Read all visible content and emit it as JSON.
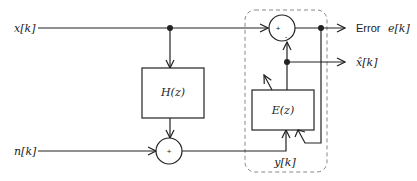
{
  "diagram": {
    "type": "block-diagram",
    "title": "",
    "inputs": [
      {
        "id": "x",
        "label": "x[k]"
      },
      {
        "id": "n",
        "label": "n[k]"
      }
    ],
    "blocks": [
      {
        "id": "H",
        "label": "H(z)"
      },
      {
        "id": "E",
        "label": "E(z)",
        "adaptive": true
      }
    ],
    "summers": [
      {
        "id": "sum_noise",
        "sign_label": "+"
      },
      {
        "id": "sum_error",
        "sign_plus": "+",
        "sign_minus": "-"
      }
    ],
    "outputs": [
      {
        "id": "error",
        "prefix": "Error",
        "label": "e[k]"
      },
      {
        "id": "xhat",
        "label": "x̂[k]"
      }
    ],
    "signals": {
      "y": "y[k]"
    },
    "colors": {
      "line": "#222222",
      "dashed_box": "#888888",
      "background": "#ffffff"
    },
    "connections": [
      {
        "from": "x",
        "to": "H"
      },
      {
        "from": "x",
        "to": "sum_error",
        "sign": "+"
      },
      {
        "from": "H",
        "to": "sum_noise"
      },
      {
        "from": "n",
        "to": "sum_noise"
      },
      {
        "from": "sum_noise",
        "to": "E",
        "signal": "y[k]"
      },
      {
        "from": "E",
        "to": "sum_error",
        "sign": "-"
      },
      {
        "from": "E",
        "to": "xhat"
      },
      {
        "from": "sum_error",
        "to": "error"
      },
      {
        "from": "error",
        "to": "E",
        "type": "adaptation-feedback"
      }
    ]
  }
}
